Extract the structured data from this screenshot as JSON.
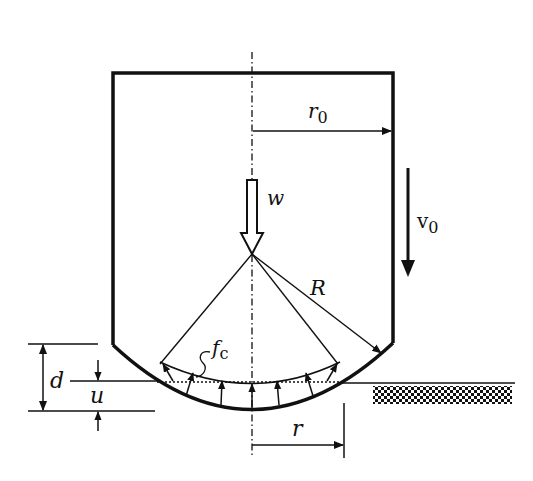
{
  "diagram": {
    "colors": {
      "stroke": "#111111",
      "background": "#ffffff"
    },
    "labels": {
      "r0": {
        "main": "r",
        "sub": "0"
      },
      "w": "w",
      "v0": {
        "main": "v",
        "sub": "0"
      },
      "R": "R",
      "fc": {
        "main": "f",
        "sub": "c"
      },
      "d": "d",
      "u": "u",
      "r": "r"
    },
    "elements": [
      "body-outline",
      "center-axis",
      "radius-r0-arrow",
      "weight-arrow-w",
      "velocity-arrow-v0",
      "radius-R-arrow",
      "contact-pressure-arrows",
      "ground-surface",
      "ground-hatch",
      "depth-d-dimension",
      "depth-u-dimension",
      "contact-radius-r-dimension"
    ]
  }
}
